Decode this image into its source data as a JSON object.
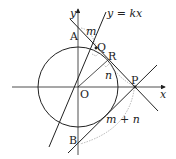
{
  "diagram": {
    "labels": {
      "y_axis": "y",
      "x_axis": "x",
      "line": "y = kx",
      "A": "A",
      "B": "B",
      "O": "O",
      "P": "P",
      "Q": "Q",
      "R": "R",
      "m": "m",
      "n": "n",
      "m_plus_n": "m + n"
    },
    "colors": {
      "stroke": "#222222",
      "dashed": "#888888",
      "background": "#ffffff"
    }
  }
}
